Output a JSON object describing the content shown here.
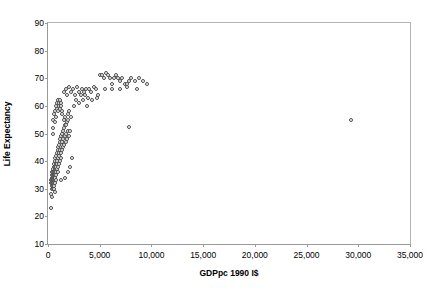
{
  "chart_data": {
    "type": "scatter",
    "title": "",
    "xlabel": "GDPpc 1990 I$",
    "ylabel": "Life Expectancy",
    "xlim": [
      0,
      35000
    ],
    "ylim": [
      10,
      90
    ],
    "xticks": [
      "0",
      "5,000",
      "10,000",
      "15,000",
      "20,000",
      "25,000",
      "30,000",
      "35,000"
    ],
    "xtick_values": [
      0,
      5000,
      10000,
      15000,
      20000,
      25000,
      30000,
      35000
    ],
    "yticks": [
      "10",
      "20",
      "30",
      "40",
      "50",
      "60",
      "70",
      "80",
      "90"
    ],
    "ytick_values": [
      10,
      20,
      30,
      40,
      50,
      60,
      70,
      80,
      90
    ],
    "grid": false,
    "legend": null,
    "marker": "open-circle",
    "marker_color": "#4a4a4a",
    "points": [
      [
        300,
        33
      ],
      [
        320,
        32
      ],
      [
        350,
        34
      ],
      [
        360,
        31
      ],
      [
        380,
        35
      ],
      [
        400,
        33
      ],
      [
        410,
        30
      ],
      [
        420,
        36
      ],
      [
        430,
        32
      ],
      [
        440,
        34
      ],
      [
        450,
        31
      ],
      [
        460,
        33
      ],
      [
        470,
        35
      ],
      [
        480,
        32
      ],
      [
        490,
        30
      ],
      [
        500,
        34
      ],
      [
        510,
        37
      ],
      [
        520,
        33
      ],
      [
        530,
        36
      ],
      [
        540,
        31
      ],
      [
        550,
        35
      ],
      [
        560,
        38
      ],
      [
        570,
        33
      ],
      [
        580,
        34
      ],
      [
        590,
        32
      ],
      [
        600,
        36
      ],
      [
        610,
        35
      ],
      [
        620,
        39
      ],
      [
        630,
        33
      ],
      [
        640,
        37
      ],
      [
        650,
        34
      ],
      [
        660,
        40
      ],
      [
        670,
        36
      ],
      [
        680,
        32
      ],
      [
        690,
        38
      ],
      [
        700,
        35
      ],
      [
        710,
        41
      ],
      [
        720,
        34
      ],
      [
        730,
        37
      ],
      [
        740,
        39
      ],
      [
        750,
        33
      ],
      [
        760,
        36
      ],
      [
        780,
        42
      ],
      [
        800,
        38
      ],
      [
        820,
        35
      ],
      [
        840,
        40
      ],
      [
        860,
        37
      ],
      [
        880,
        43
      ],
      [
        900,
        39
      ],
      [
        920,
        36
      ],
      [
        940,
        44
      ],
      [
        960,
        41
      ],
      [
        980,
        38
      ],
      [
        1000,
        45
      ],
      [
        1020,
        42
      ],
      [
        1050,
        39
      ],
      [
        1080,
        46
      ],
      [
        1100,
        43
      ],
      [
        1120,
        40
      ],
      [
        1150,
        47
      ],
      [
        1180,
        44
      ],
      [
        1200,
        48
      ],
      [
        1220,
        41
      ],
      [
        1250,
        45
      ],
      [
        1280,
        49
      ],
      [
        1300,
        43
      ],
      [
        1320,
        46
      ],
      [
        1350,
        50
      ],
      [
        1380,
        44
      ],
      [
        1400,
        47
      ],
      [
        1420,
        51
      ],
      [
        1450,
        45
      ],
      [
        1480,
        48
      ],
      [
        1500,
        52
      ],
      [
        1550,
        46
      ],
      [
        1600,
        49
      ],
      [
        1650,
        53
      ],
      [
        1700,
        47
      ],
      [
        1750,
        50
      ],
      [
        1800,
        54
      ],
      [
        1850,
        48
      ],
      [
        1900,
        51
      ],
      [
        1950,
        55
      ],
      [
        2000,
        49
      ],
      [
        330,
        28
      ],
      [
        380,
        27
      ],
      [
        300,
        23
      ],
      [
        620,
        30
      ],
      [
        680,
        29
      ],
      [
        1250,
        33
      ],
      [
        1600,
        34
      ],
      [
        1900,
        36
      ],
      [
        2100,
        38
      ],
      [
        2300,
        41
      ],
      [
        450,
        52
      ],
      [
        500,
        55
      ],
      [
        480,
        50
      ],
      [
        600,
        57
      ],
      [
        650,
        54
      ],
      [
        700,
        58
      ],
      [
        750,
        56
      ],
      [
        800,
        60
      ],
      [
        850,
        59
      ],
      [
        900,
        61
      ],
      [
        950,
        58
      ],
      [
        1000,
        62
      ],
      [
        1050,
        60
      ],
      [
        1100,
        61
      ],
      [
        1150,
        59
      ],
      [
        1200,
        62
      ],
      [
        1250,
        60
      ],
      [
        1300,
        61
      ],
      [
        1350,
        58
      ],
      [
        1400,
        57
      ],
      [
        1500,
        55
      ],
      [
        1600,
        56
      ],
      [
        1700,
        53
      ],
      [
        1900,
        57
      ],
      [
        2000,
        58
      ],
      [
        2100,
        51
      ],
      [
        2200,
        56
      ],
      [
        1500,
        65
      ],
      [
        1700,
        66
      ],
      [
        1800,
        64
      ],
      [
        2000,
        67
      ],
      [
        2200,
        65
      ],
      [
        2400,
        66
      ],
      [
        2600,
        64
      ],
      [
        2800,
        67
      ],
      [
        3000,
        65
      ],
      [
        3200,
        64
      ],
      [
        3300,
        66
      ],
      [
        3500,
        65
      ],
      [
        3600,
        64
      ],
      [
        3700,
        66
      ],
      [
        3900,
        63
      ],
      [
        4000,
        66
      ],
      [
        4200,
        65
      ],
      [
        4400,
        67
      ],
      [
        4600,
        66
      ],
      [
        4800,
        64
      ],
      [
        2500,
        60
      ],
      [
        2700,
        62
      ],
      [
        3000,
        61
      ],
      [
        3400,
        62
      ],
      [
        3800,
        60
      ],
      [
        4300,
        62
      ],
      [
        4700,
        63
      ],
      [
        5000,
        71
      ],
      [
        5200,
        71
      ],
      [
        5400,
        70
      ],
      [
        5600,
        72
      ],
      [
        5800,
        71
      ],
      [
        6000,
        70
      ],
      [
        6200,
        68
      ],
      [
        6400,
        70
      ],
      [
        6600,
        71
      ],
      [
        6800,
        70
      ],
      [
        7000,
        69
      ],
      [
        7200,
        70
      ],
      [
        7400,
        68
      ],
      [
        7600,
        68
      ],
      [
        7800,
        69
      ],
      [
        8000,
        70
      ],
      [
        8400,
        69
      ],
      [
        8800,
        70
      ],
      [
        9200,
        69
      ],
      [
        9600,
        68
      ],
      [
        5500,
        66
      ],
      [
        6200,
        66
      ],
      [
        7000,
        66
      ],
      [
        7600,
        67
      ],
      [
        8600,
        66
      ],
      [
        7800,
        52.5
      ],
      [
        29300,
        55
      ]
    ]
  }
}
